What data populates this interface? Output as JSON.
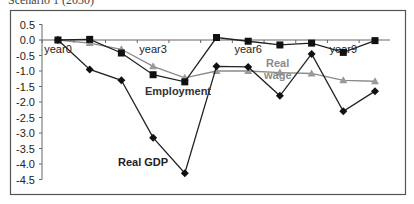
{
  "title": "Scenario 1 (2030)",
  "chart_data": {
    "type": "line",
    "title": "Scenario 1 (2030)",
    "xlabel": "",
    "ylabel": "",
    "categories": [
      "year0",
      "year1",
      "year2",
      "year3",
      "year4",
      "year5",
      "year6",
      "year7",
      "year8",
      "year9",
      "year10"
    ],
    "visible_category_labels": [
      "year0",
      "year3",
      "year6",
      "year9"
    ],
    "ylim": [
      -4.5,
      0.5
    ],
    "yticks": [
      "0.5",
      "0.0",
      "-0.5",
      "-1.0",
      "-1.5",
      "-2.0",
      "-2.5",
      "-3.0",
      "-3.5",
      "-4.0",
      "-4.5"
    ],
    "grid": false,
    "legend": "inline labels",
    "series": [
      {
        "name": "Real GDP",
        "marker": "diamond",
        "color": "#111111",
        "values": [
          0.0,
          -0.95,
          -1.3,
          -3.15,
          -4.3,
          -0.85,
          -0.87,
          -1.8,
          -0.45,
          -2.3,
          -1.65
        ]
      },
      {
        "name": "Employment",
        "marker": "square",
        "color": "#111111",
        "values": [
          0.0,
          0.02,
          -0.42,
          -1.12,
          -1.35,
          0.08,
          -0.04,
          -0.16,
          -0.1,
          -0.4,
          -0.02
        ]
      },
      {
        "name": "Real wage",
        "marker": "triangle",
        "color": "#888888",
        "values": [
          0.0,
          -0.1,
          -0.3,
          -0.85,
          -1.22,
          -1.0,
          -1.0,
          -1.05,
          -1.08,
          -1.3,
          -1.33
        ]
      }
    ],
    "annotations": [
      {
        "text": "Employment",
        "x": "year4",
        "y": -1.7
      },
      {
        "text": "Real wage",
        "x": "year7",
        "y": -0.9
      },
      {
        "text": "Real GDP",
        "x": "year3",
        "y": -3.9
      }
    ]
  }
}
